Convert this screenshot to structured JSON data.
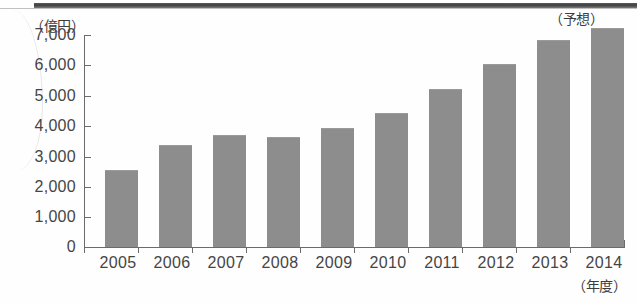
{
  "chart_data": {
    "type": "bar",
    "title": "",
    "subtitle": "",
    "xlabel": "（年度）",
    "ylabel": "（億円）",
    "categories": [
      "2005",
      "2006",
      "2007",
      "2008",
      "2009",
      "2010",
      "2011",
      "2012",
      "2013",
      "2014"
    ],
    "values": [
      2500,
      3350,
      3650,
      3600,
      3900,
      4400,
      5200,
      6000,
      6800,
      7200
    ],
    "ylim": [
      0,
      7000
    ],
    "ytick_labels": [
      "7,000",
      "6,000",
      "5,000",
      "4,000",
      "3,000",
      "2,000",
      "1,000",
      "0"
    ],
    "ytick_values": [
      7000,
      6000,
      5000,
      4000,
      3000,
      2000,
      1000,
      0
    ],
    "grid": false,
    "legend": null,
    "annotations": [
      {
        "text": "（予想）",
        "target_category": "2014",
        "position": "above-bar"
      }
    ],
    "series": [
      {
        "name": "",
        "values": [
          2500,
          3350,
          3650,
          3600,
          3900,
          4400,
          5200,
          6000,
          6800,
          7200
        ]
      }
    ],
    "colors": {
      "bar_fill": "#8d8d8d",
      "axis": "#6b6b6b",
      "tick_text": "#454545",
      "unit_text": "#3c3c3c",
      "background": "#fefefe"
    }
  }
}
